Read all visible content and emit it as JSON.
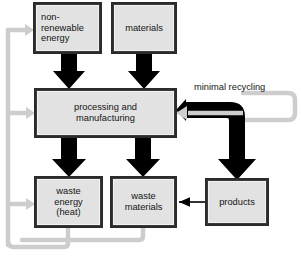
{
  "diagram": {
    "colors": {
      "node_fill": "#e2e2e2",
      "node_border": "#2b2b2b",
      "thick_arrow": "#000000",
      "thin_arrow": "#000000",
      "feedback_arrow": "#c9c9c9",
      "text": "#141414",
      "background": "#ffffff"
    },
    "nodes": [
      {
        "id": "non-renewable-energy",
        "label": "non-\nrenewable\nenergy",
        "align": "left"
      },
      {
        "id": "materials",
        "label": "materials",
        "align": "center"
      },
      {
        "id": "processing-and-manufacturing",
        "label": "processing and\nmanufacturing",
        "align": "center"
      },
      {
        "id": "waste-energy-heat",
        "label": "waste\nenergy\n(heat)",
        "align": "center"
      },
      {
        "id": "waste-materials",
        "label": "waste\nmaterials",
        "align": "center"
      },
      {
        "id": "products",
        "label": "products",
        "align": "center"
      }
    ],
    "edge_labels": [
      {
        "id": "minimal-recycling",
        "text": "minimal recycling"
      }
    ],
    "edges": [
      {
        "from": "non-renewable-energy",
        "to": "processing-and-manufacturing",
        "style": "thick-black",
        "direction": "down"
      },
      {
        "from": "materials",
        "to": "processing-and-manufacturing",
        "style": "thick-black",
        "direction": "down"
      },
      {
        "from": "processing-and-manufacturing",
        "to": "waste-energy-heat",
        "style": "thick-black",
        "direction": "down"
      },
      {
        "from": "processing-and-manufacturing",
        "to": "waste-materials",
        "style": "thick-black",
        "direction": "down"
      },
      {
        "from": "processing-and-manufacturing",
        "to": "products",
        "style": "thick-black",
        "direction": "right-then-down"
      },
      {
        "from": "products",
        "to": "waste-materials",
        "style": "thin-black",
        "direction": "left"
      },
      {
        "from": "products",
        "to": "processing-and-manufacturing",
        "style": "gray-feedback",
        "direction": "left",
        "label": "minimal recycling"
      },
      {
        "from": "waste-energy-heat",
        "to": "non-renewable-energy",
        "style": "gray-feedback",
        "direction": "loop-left"
      },
      {
        "from": "waste-materials",
        "to": "processing-and-manufacturing",
        "style": "gray-feedback",
        "direction": "loop-left"
      },
      {
        "from": "waste-materials",
        "to": "waste-energy-heat",
        "style": "gray-feedback",
        "direction": "loop-left"
      }
    ]
  }
}
